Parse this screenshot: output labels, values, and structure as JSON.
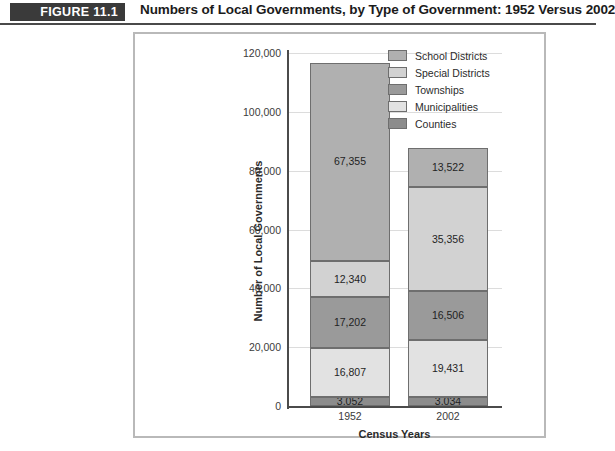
{
  "figure": {
    "badge": "FIGURE 11.1",
    "title": "Numbers of Local Governments, by Type of Government: 1952 Versus 2002"
  },
  "chart_data": {
    "type": "bar",
    "subtype": "stacked",
    "title": "Numbers of Local Governments, by Type of Government: 1952 Versus 2002",
    "xlabel": "Census Years",
    "ylabel": "Number of Local Governments",
    "categories": [
      "1952",
      "2002"
    ],
    "ylim": [
      0,
      120000
    ],
    "yticks": [
      0,
      20000,
      40000,
      60000,
      80000,
      100000,
      120000
    ],
    "ytick_labels": [
      "0",
      "20,000",
      "40,000",
      "60,000",
      "80,000",
      "100,000",
      "120,000"
    ],
    "grid": true,
    "legend_position": "top-right",
    "stack_order_bottom_to_top": [
      "Counties",
      "Municipalities",
      "Townships",
      "Special Districts",
      "School Districts"
    ],
    "series": [
      {
        "name": "Counties",
        "color": "#8c8c8c",
        "values": [
          3052,
          3034
        ],
        "labels": [
          "3,052",
          "3,034"
        ]
      },
      {
        "name": "Municipalities",
        "color": "#e2e2e2",
        "values": [
          16807,
          19431
        ],
        "labels": [
          "16,807",
          "19,431"
        ]
      },
      {
        "name": "Townships",
        "color": "#9a9a9a",
        "values": [
          17202,
          16506
        ],
        "labels": [
          "17,202",
          "16,506"
        ]
      },
      {
        "name": "Special Districts",
        "color": "#d2d2d2",
        "values": [
          12340,
          35356
        ],
        "labels": [
          "12,340",
          "35,356"
        ]
      },
      {
        "name": "School Districts",
        "color": "#b0b0b0",
        "values": [
          67355,
          13522
        ],
        "labels": [
          "67,355",
          "13,522"
        ]
      }
    ],
    "totals": [
      116756,
      87849
    ]
  },
  "legend": {
    "items": [
      {
        "label": "School Districts",
        "color": "#b0b0b0"
      },
      {
        "label": "Special Districts",
        "color": "#d2d2d2"
      },
      {
        "label": "Townships",
        "color": "#9a9a9a"
      },
      {
        "label": "Municipalities",
        "color": "#e2e2e2"
      },
      {
        "label": "Counties",
        "color": "#8c8c8c"
      }
    ]
  }
}
